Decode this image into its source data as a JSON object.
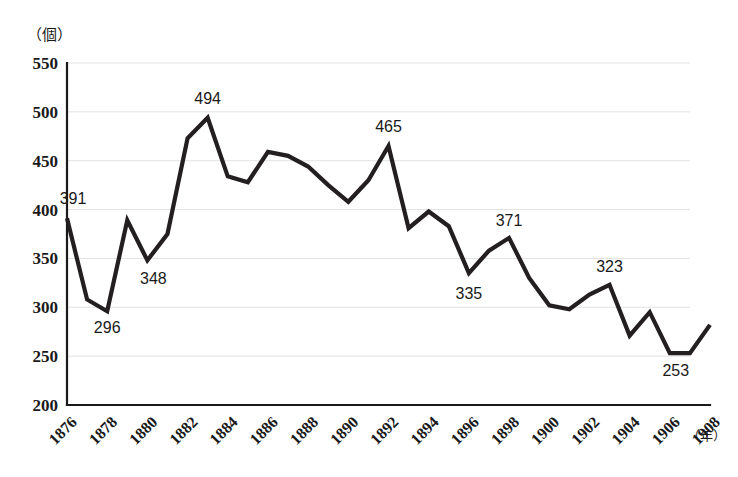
{
  "chart_data": {
    "type": "line",
    "title": "",
    "xlabel": "年",
    "ylabel": "個",
    "y_unit_label": "（個）",
    "x_unit_label": "（年）",
    "xlim": [
      1876,
      1908
    ],
    "ylim": [
      200,
      550
    ],
    "grid": true,
    "legend": "none",
    "y_ticks": [
      550,
      500,
      450,
      400,
      350,
      300,
      250,
      200
    ],
    "x_ticks": [
      1876,
      1878,
      1880,
      1882,
      1884,
      1886,
      1888,
      1890,
      1892,
      1894,
      1896,
      1898,
      1900,
      1902,
      1904,
      1906,
      1908
    ],
    "x": [
      1876,
      1877,
      1878,
      1879,
      1880,
      1881,
      1882,
      1883,
      1884,
      1885,
      1886,
      1887,
      1888,
      1889,
      1890,
      1891,
      1892,
      1893,
      1894,
      1895,
      1896,
      1897,
      1898,
      1899,
      1900,
      1901,
      1902,
      1903,
      1904,
      1905,
      1906,
      1907,
      1908
    ],
    "values": [
      391,
      308,
      296,
      389,
      348,
      375,
      473,
      494,
      434,
      428,
      459,
      455,
      444,
      425,
      408,
      430,
      465,
      381,
      398,
      383,
      335,
      358,
      371,
      330,
      302,
      298,
      313,
      323,
      271,
      295,
      253,
      253,
      282
    ],
    "series": [
      {
        "name": "個数",
        "values": [
          391,
          308,
          296,
          389,
          348,
          375,
          473,
          494,
          434,
          428,
          459,
          455,
          444,
          425,
          408,
          430,
          465,
          381,
          398,
          383,
          335,
          358,
          371,
          330,
          302,
          298,
          313,
          323,
          271,
          295,
          253,
          253,
          282
        ]
      }
    ],
    "annotations": [
      {
        "year": 1876,
        "value": 391,
        "text": "391",
        "dx": 6,
        "dy": -14,
        "anchor": "start"
      },
      {
        "year": 1878,
        "value": 296,
        "text": "296",
        "dx": 0,
        "dy": 22,
        "anchor": "middle"
      },
      {
        "year": 1880,
        "value": 348,
        "text": "348",
        "dx": 6,
        "dy": 24,
        "anchor": "start"
      },
      {
        "year": 1883,
        "value": 494,
        "text": "494",
        "dx": 0,
        "dy": -14,
        "anchor": "middle"
      },
      {
        "year": 1892,
        "value": 465,
        "text": "465",
        "dx": 0,
        "dy": -14,
        "anchor": "middle"
      },
      {
        "year": 1896,
        "value": 335,
        "text": "335",
        "dx": 0,
        "dy": 26,
        "anchor": "middle"
      },
      {
        "year": 1898,
        "value": 371,
        "text": "371",
        "dx": 0,
        "dy": -12,
        "anchor": "middle"
      },
      {
        "year": 1903,
        "value": 323,
        "text": "323",
        "dx": 0,
        "dy": -13,
        "anchor": "middle"
      },
      {
        "year": 1906,
        "value": 253,
        "text": "253",
        "dx": 6,
        "dy": 23,
        "anchor": "start"
      }
    ],
    "colors": {
      "line": "#231f20",
      "axis": "#1a1a1a",
      "grid": "#e2e2e2",
      "text": "#1a1a1a",
      "background": "#ffffff"
    }
  },
  "layout": {
    "plot_left": 67,
    "plot_right": 710,
    "plot_top": 63,
    "plot_bottom": 405,
    "grid_right": 690
  }
}
